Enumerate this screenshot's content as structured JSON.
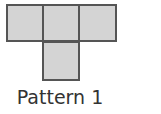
{
  "diagram": {
    "caption": "Pattern 1",
    "squares": [
      {
        "row": 0,
        "col": 0
      },
      {
        "row": 0,
        "col": 1
      },
      {
        "row": 0,
        "col": 2
      },
      {
        "row": 1,
        "col": 1
      }
    ],
    "fill_color": "#d4d4d4",
    "border_color": "#555555"
  }
}
